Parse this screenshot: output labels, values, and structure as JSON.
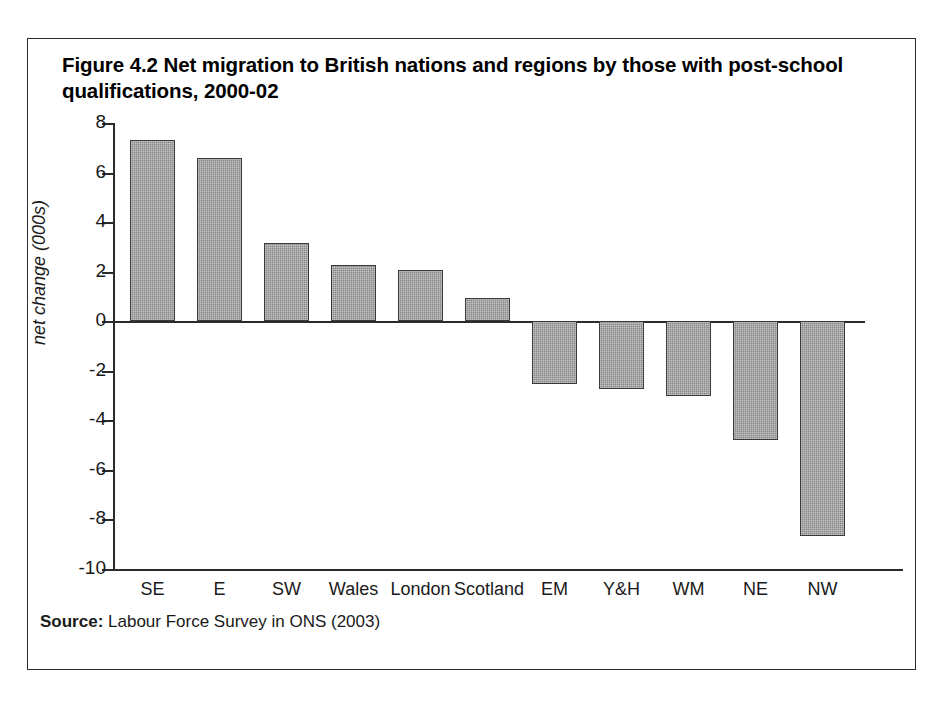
{
  "figure": {
    "title": "Figure 4.2 Net migration to British nations and regions by those with post-school qualifications, 2000-02",
    "source_label": "Source:",
    "source_text": " Labour Force Survey in ONS (2003)"
  },
  "colors": {
    "bar_fill": "#8a8a8a",
    "bar_border": "#3a3a3a",
    "axis": "#2b2b2b",
    "frame": "#2b2b2b",
    "text": "#1a1a1a",
    "background": "#ffffff"
  },
  "chart_data": {
    "type": "bar",
    "title": "Figure 4.2 Net migration to British nations and regions by those with post-school qualifications, 2000-02",
    "xlabel": "",
    "ylabel": "net change (000s)",
    "categories": [
      "SE",
      "E",
      "SW",
      "Wales",
      "London",
      "Scotland",
      "EM",
      "Y&H",
      "WM",
      "NE",
      "NW"
    ],
    "values": [
      7.3,
      6.6,
      3.15,
      2.25,
      2.05,
      0.95,
      -2.55,
      -2.75,
      -3.0,
      -4.8,
      -8.65
    ],
    "ylim": [
      -10,
      8
    ],
    "yticks": [
      8,
      6,
      4,
      2,
      0,
      -2,
      -4,
      -6,
      -8,
      -10
    ],
    "ytick_labels": [
      "8",
      "6",
      "4",
      "2",
      "0",
      "-2",
      "-4",
      "-6",
      "-8",
      "-10"
    ],
    "grid": false,
    "legend": null,
    "annotations": []
  }
}
